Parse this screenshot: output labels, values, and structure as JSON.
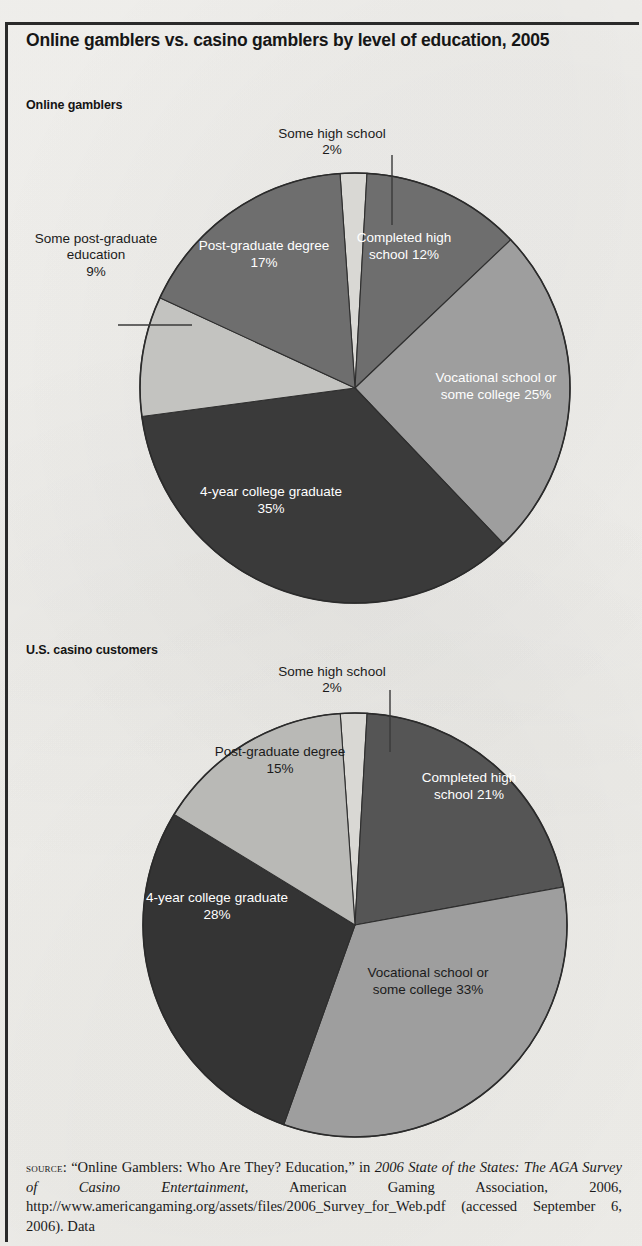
{
  "title": "Online gamblers vs. casino gamblers by level of education, 2005",
  "charts": [
    {
      "heading": "Online gamblers",
      "callouts": [
        {
          "label": "Some high school",
          "pct": "2%"
        },
        {
          "label": "Some post-graduate education",
          "pct": "9%"
        }
      ],
      "inner": [
        {
          "label": "Completed high school",
          "pct": "12%"
        },
        {
          "label": "Vocational school or some college",
          "pct": "25%"
        },
        {
          "label": "4-year college graduate",
          "pct": "35%"
        },
        {
          "label": "Post-graduate degree",
          "pct": "17%"
        }
      ]
    },
    {
      "heading": "U.S. casino customers",
      "callouts": [
        {
          "label": "Some high school",
          "pct": "2%"
        }
      ],
      "inner": [
        {
          "label": "Completed high school",
          "pct": "21%"
        },
        {
          "label": "Vocational school or some college",
          "pct": "33%"
        },
        {
          "label": "4-year college graduate",
          "pct": "28%"
        },
        {
          "label": "Post-graduate degree",
          "pct": "15%"
        }
      ]
    }
  ],
  "source": {
    "word": "source",
    "text_1": ": “Online Gamblers: Who Are They? Education,” in ",
    "italic_1": "2006 State of the States: The AGA Survey of Casino Entertainment",
    "text_2": ", American Gaming Association, 2006, http://www.americangaming.org/assets/files/2006_Survey_for_Web.pdf (accessed September 6, 2006). Data"
  },
  "chart_data": [
    {
      "type": "pie",
      "title": "Online gamblers",
      "labels": [
        "Some high school",
        "Completed high school",
        "Vocational school or some college",
        "4-year college graduate",
        "Some post-graduate education",
        "Post-graduate degree"
      ],
      "values": [
        2,
        12,
        25,
        35,
        9,
        17
      ],
      "unit": "%",
      "colors": [
        "#d9d8d4",
        "#6e6e6e",
        "#9e9e9e",
        "#3a3a3a",
        "#c3c3c0",
        "#6e6e6e"
      ],
      "start_angle_deg": -4,
      "direction": "clockwise",
      "legend": "none",
      "grid": false,
      "center": [
        355,
        388
      ],
      "radius": 215
    },
    {
      "type": "pie",
      "title": "U.S. casino customers",
      "labels": [
        "Some high school",
        "Completed high school",
        "Vocational school or some college",
        "4-year college graduate",
        "Post-graduate degree"
      ],
      "values": [
        2,
        21,
        33,
        28,
        15
      ],
      "unit": "%",
      "colors": [
        "#d9d8d4",
        "#555555",
        "#9e9e9e",
        "#343434",
        "#b9b9b6"
      ],
      "start_angle_deg": -4,
      "direction": "clockwise",
      "legend": "none",
      "grid": false,
      "center": [
        355,
        925
      ],
      "radius": 212
    }
  ]
}
